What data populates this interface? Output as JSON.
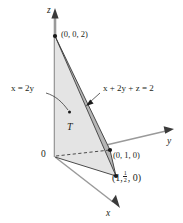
{
  "figure": {
    "axes": {
      "x_label": "x",
      "y_label": "y",
      "z_label": "z",
      "origin_label": "0"
    },
    "region": {
      "label": "T"
    },
    "points": [
      {
        "name": "z-intercept",
        "label": "(0, 0, 2)"
      },
      {
        "name": "y-intercept",
        "label": "(0, 1, 0)"
      },
      {
        "name": "xy-point-prefix",
        "label": "(1,"
      },
      {
        "name": "xy-point-frac-num",
        "label": "1"
      },
      {
        "name": "xy-point-frac-den",
        "label": "2"
      },
      {
        "name": "xy-point-suffix",
        "label": ", 0)"
      }
    ],
    "equations": {
      "plane_left_prefix": "x",
      "plane_left_mid": " = 2",
      "plane_left_suffix": "y",
      "plane_left_full": "x = 2y",
      "plane_right_full": "x + 2y + z = 2"
    },
    "colors": {
      "stroke": "#231f20",
      "axis": "#8d8d8d",
      "light_fill": "#e3e3e3",
      "dark_fill": "#b9b9b9",
      "base_fill": "#d9d9d9",
      "background": "#ffffff"
    }
  }
}
